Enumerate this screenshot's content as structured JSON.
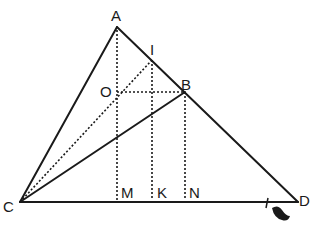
{
  "diagram": {
    "type": "geometry",
    "colors": {
      "ink": "#1a1a1a",
      "background": "#ffffff"
    },
    "points": {
      "A": {
        "label": "A",
        "x": 117,
        "y": 27
      },
      "I": {
        "label": "I",
        "x": 152,
        "y": 60
      },
      "B": {
        "label": "B",
        "x": 185,
        "y": 92
      },
      "O": {
        "label": "O",
        "x": 117,
        "y": 92
      },
      "C": {
        "label": "C",
        "x": 20,
        "y": 202
      },
      "D": {
        "label": "D",
        "x": 298,
        "y": 202
      },
      "M": {
        "label": "M",
        "x": 117,
        "y": 202
      },
      "K": {
        "label": "K",
        "x": 152,
        "y": 202
      },
      "N": {
        "label": "N",
        "x": 185,
        "y": 202
      }
    },
    "solid_segments": [
      "CA",
      "AD",
      "CD",
      "CB"
    ],
    "dotted_segments": [
      "AM",
      "IK",
      "BN",
      "OB",
      "CI"
    ],
    "tick_mark_on": "CD near D"
  }
}
